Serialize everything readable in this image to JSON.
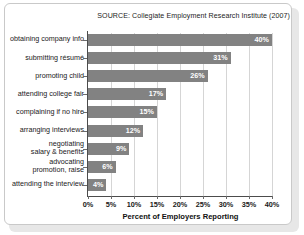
{
  "source_note": "SOURCE: Collegiate Employment Research Institute (2007)",
  "chart_data": {
    "type": "bar",
    "orientation": "horizontal",
    "title": "",
    "subtitle": "",
    "xlabel": "Percent of Employers Reporting",
    "ylabel": "",
    "xlim": [
      0,
      40
    ],
    "xtick_labels": [
      "0%",
      "5%",
      "10%",
      "15%",
      "20%",
      "25%",
      "30%",
      "35%",
      "40%"
    ],
    "xtick_values": [
      0,
      5,
      10,
      15,
      20,
      25,
      30,
      35,
      40
    ],
    "grid": true,
    "legend": "none",
    "bar_color": "#828282",
    "categories": [
      "obtaining company info",
      "submitting résumé",
      "promoting child",
      "attending college fair",
      "complaining if no hire",
      "arranging interviews",
      "negotiating\nsalary & benefits",
      "advocating\npromotion, raise",
      "attending the interview"
    ],
    "values": [
      40,
      31,
      26,
      17,
      15,
      12,
      9,
      6,
      4
    ],
    "data_labels": [
      "40%",
      "31%",
      "26%",
      "17%",
      "15%",
      "12%",
      "9%",
      "6%",
      "4%"
    ],
    "bars": [
      {
        "category": "obtaining company info",
        "category_lines": [
          "obtaining company info"
        ],
        "value": 40,
        "label": "40%"
      },
      {
        "category": "submitting résumé",
        "category_lines": [
          "submitting résumé"
        ],
        "value": 31,
        "label": "31%"
      },
      {
        "category": "promoting child",
        "category_lines": [
          "promoting child"
        ],
        "value": 26,
        "label": "26%"
      },
      {
        "category": "attending college fair",
        "category_lines": [
          "attending college fair"
        ],
        "value": 17,
        "label": "17%"
      },
      {
        "category": "complaining if no hire",
        "category_lines": [
          "complaining if no hire"
        ],
        "value": 15,
        "label": "15%"
      },
      {
        "category": "arranging interviews",
        "category_lines": [
          "arranging interviews"
        ],
        "value": 12,
        "label": "12%"
      },
      {
        "category": "negotiating salary & benefits",
        "category_lines": [
          "negotiating",
          "salary & benefits"
        ],
        "value": 9,
        "label": "9%"
      },
      {
        "category": "advocating promotion, raise",
        "category_lines": [
          "advocating",
          "promotion, raise"
        ],
        "value": 6,
        "label": "6%"
      },
      {
        "category": "attending the interview",
        "category_lines": [
          "attending the interview"
        ],
        "value": 4,
        "label": "4%"
      }
    ]
  }
}
